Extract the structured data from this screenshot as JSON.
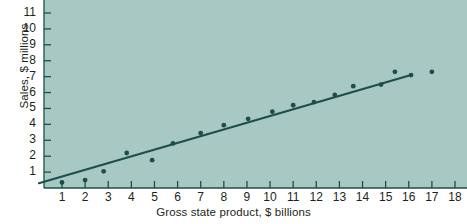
{
  "figure": {
    "background_color": "#ffffff",
    "plot_background_color": "#a8c8c4",
    "ink_color": "#1b4f4a",
    "text_color": "#231f20"
  },
  "chart_data": {
    "type": "scatter",
    "title": "",
    "subtitle": "",
    "xlabel": "Gross state product, $ billions",
    "ylabel": "Sales, $ millions",
    "xlim": [
      0,
      18
    ],
    "ylim": [
      0,
      12
    ],
    "xticks": [
      1,
      2,
      3,
      4,
      5,
      6,
      7,
      8,
      9,
      10,
      11,
      12,
      13,
      14,
      15,
      16,
      17,
      18
    ],
    "yticks": [
      1,
      2,
      3,
      4,
      5,
      6,
      7,
      8,
      9,
      10,
      11,
      12
    ],
    "xtick_labels": [
      "1",
      "2",
      "3",
      "4",
      "5",
      "6",
      "7",
      "8",
      "9",
      "10",
      "11",
      "12",
      "13",
      "14",
      "15",
      "16",
      "17",
      "18"
    ],
    "ytick_labels": [
      "1",
      "2",
      "3",
      "4",
      "5",
      "6",
      "7",
      "8",
      "9",
      "10",
      "11",
      "12"
    ],
    "grid": false,
    "legend": null,
    "annotations": [],
    "series": [
      {
        "name": "Observations",
        "type": "scatter",
        "marker": "circle",
        "color": "#1b4f4a",
        "points": [
          {
            "x": 1.0,
            "y": 0.35
          },
          {
            "x": 2.0,
            "y": 0.5
          },
          {
            "x": 2.8,
            "y": 1.05
          },
          {
            "x": 3.8,
            "y": 2.2
          },
          {
            "x": 4.9,
            "y": 1.75
          },
          {
            "x": 5.8,
            "y": 2.8
          },
          {
            "x": 7.0,
            "y": 3.45
          },
          {
            "x": 8.0,
            "y": 3.95
          },
          {
            "x": 9.05,
            "y": 4.35
          },
          {
            "x": 10.1,
            "y": 4.8
          },
          {
            "x": 11.0,
            "y": 5.2
          },
          {
            "x": 11.9,
            "y": 5.4
          },
          {
            "x": 12.8,
            "y": 5.85
          },
          {
            "x": 13.6,
            "y": 6.4
          },
          {
            "x": 14.8,
            "y": 6.5
          },
          {
            "x": 15.4,
            "y": 7.3
          },
          {
            "x": 16.1,
            "y": 7.1
          },
          {
            "x": 17.0,
            "y": 7.3
          }
        ]
      },
      {
        "name": "Regression line",
        "type": "line",
        "color": "#1b4f4a",
        "points": [
          {
            "x": 0.0,
            "y": 0.3
          },
          {
            "x": 16.1,
            "y": 7.1
          }
        ]
      }
    ]
  }
}
